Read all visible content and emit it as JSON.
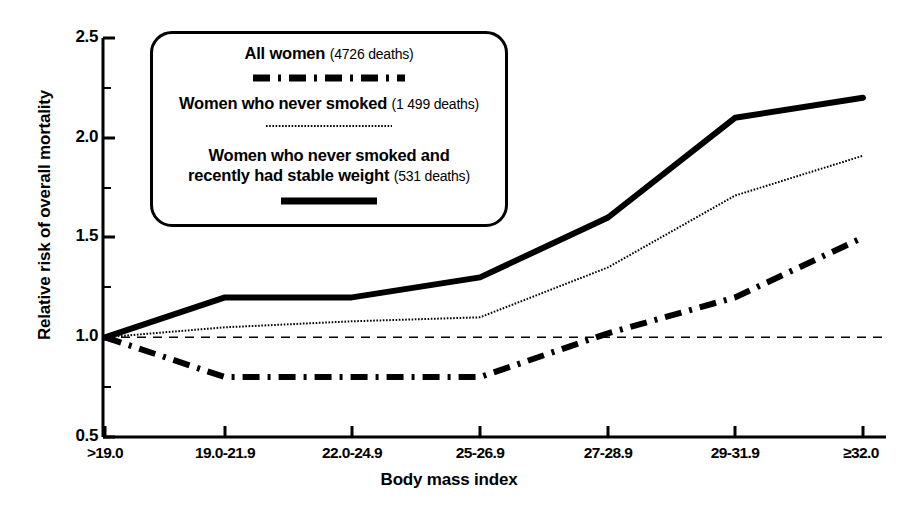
{
  "chart_data": {
    "type": "line",
    "title": "",
    "xlabel": "Body mass index",
    "ylabel": "Relative risk of overall mortality",
    "categories": [
      ">19.0",
      "19.0-21.9",
      "22.0-24.9",
      "25-26.9",
      "27-28.9",
      "29-31.9",
      "≥32.0"
    ],
    "ylim": [
      0.5,
      2.5
    ],
    "yticks": [
      "0.5",
      "1.0",
      "1.5",
      "2.0",
      "2.5"
    ],
    "ytick_values": [
      0.5,
      1.0,
      1.5,
      2.0,
      2.5
    ],
    "minor_yticks": [
      0.75,
      1.25,
      1.75,
      2.25
    ],
    "grid": false,
    "legend_position": "upper-left-inside",
    "reference_line": {
      "y": 1.0,
      "style": "dashed",
      "color": "#000000"
    },
    "series": [
      {
        "name": "All women",
        "count_label": "(4726 deaths)",
        "style": "solid",
        "width": 6,
        "color": "#000000",
        "values": [
          1.0,
          1.2,
          1.2,
          1.3,
          1.6,
          2.1,
          2.2
        ]
      },
      {
        "name": "Women who never smoked",
        "count_label": "(1 499 deaths)",
        "style": "dotted",
        "width": 2,
        "color": "#000000",
        "values": [
          1.0,
          1.05,
          1.08,
          1.1,
          1.35,
          1.71,
          1.91
        ]
      },
      {
        "name": "Women who never smoked and recently had stable weight",
        "name_line1": "Women who never smoked and",
        "name_line2": "recently had stable weight",
        "count_label": "(531 deaths)",
        "style": "dash-dot",
        "width": 6,
        "color": "#000000",
        "values": [
          1.0,
          0.8,
          0.8,
          0.8,
          1.02,
          1.2,
          1.5
        ]
      }
    ]
  },
  "axes": {
    "ylabel": "Relative risk of overall mortality",
    "xlabel": "Body mass index",
    "ytick_labels": [
      "2.5",
      "2.0",
      "1.5",
      "1.0",
      "0.5"
    ],
    "xtick_labels": [
      ">19.0",
      "19.0-21.9",
      "22.0-24.9",
      "25-26.9",
      "27-28.9",
      "29-31.9",
      "≥32.0"
    ]
  },
  "legend": {
    "entries": [
      {
        "label": "All women",
        "count": "(4726 deaths)",
        "swatch": "dash-dot-line-swatch"
      },
      {
        "label": "Women who never smoked",
        "count": "(1 499 deaths)",
        "swatch": "dotted-line-swatch"
      },
      {
        "label_line1": "Women who never smoked and",
        "label_line2": "recently had stable weight",
        "count": "(531 deaths)",
        "swatch": "solid-line-swatch"
      }
    ]
  }
}
